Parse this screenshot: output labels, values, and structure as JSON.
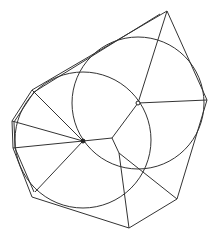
{
  "diagram": {
    "type": "geometric-construction",
    "width": 217,
    "height": 239,
    "stroke_color": "#333333",
    "circles": [
      {
        "name": "large-circle",
        "cx": 138,
        "cy": 103,
        "r": 66
      },
      {
        "name": "small-circle",
        "cx": 83,
        "cy": 140,
        "r": 68
      }
    ],
    "points": [
      {
        "name": "large-circle-center",
        "x": 138,
        "y": 103,
        "style": "hollow"
      },
      {
        "name": "small-circle-center",
        "x": 83,
        "y": 141,
        "style": "filled"
      },
      {
        "name": "junction",
        "x": 112,
        "y": 138,
        "style": "none"
      }
    ],
    "outer_polygon": [
      [
        167,
        11
      ],
      [
        207,
        100
      ],
      [
        177,
        199
      ],
      [
        129,
        228
      ],
      [
        32,
        197
      ],
      [
        13,
        148
      ],
      [
        12,
        121
      ],
      [
        32,
        90
      ]
    ],
    "inner_outline": [
      [
        160,
        14
      ],
      [
        34,
        92
      ],
      [
        14,
        122
      ],
      [
        15,
        148
      ],
      [
        34,
        192
      ]
    ],
    "edges": [
      [
        [
          138,
          103
        ],
        [
          167,
          11
        ]
      ],
      [
        [
          138,
          103
        ],
        [
          207,
          100
        ]
      ],
      [
        [
          138,
          103
        ],
        [
          112,
          138
        ]
      ],
      [
        [
          83,
          141
        ],
        [
          112,
          138
        ]
      ],
      [
        [
          83,
          141
        ],
        [
          32,
          90
        ]
      ],
      [
        [
          83,
          141
        ],
        [
          12,
          121
        ]
      ],
      [
        [
          83,
          141
        ],
        [
          13,
          148
        ]
      ],
      [
        [
          83,
          141
        ],
        [
          35,
          192
        ]
      ],
      [
        [
          112,
          138
        ],
        [
          119,
          153
        ]
      ],
      [
        [
          119,
          153
        ],
        [
          129,
          228
        ]
      ],
      [
        [
          119,
          153
        ],
        [
          177,
          199
        ]
      ]
    ]
  }
}
